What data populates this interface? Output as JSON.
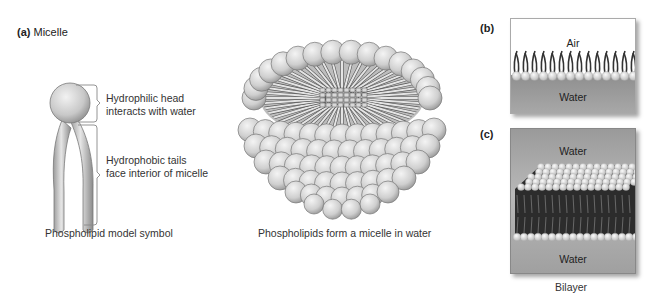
{
  "panel_a": {
    "tag": "(a)",
    "title": "Micelle",
    "annotations": {
      "head_line1": "Hydrophilic head",
      "head_line2": "interacts with water",
      "tails_line1": "Hydrophobic tails",
      "tails_line2": "face interior of micelle"
    },
    "symbol_caption": "Phospholipid model symbol",
    "micelle_caption": "Phospholipids form a micelle in water"
  },
  "panel_b": {
    "tag": "(b)",
    "top_label": "Air",
    "bottom_label": "Water"
  },
  "panel_c": {
    "tag": "(c)",
    "top_label": "Water",
    "bottom_label": "Water",
    "caption": "Bilayer"
  },
  "colors": {
    "sphere": "#d9d9d9",
    "sphere_edge": "#7a7a7a",
    "water": "#9a9a9a",
    "tails_dark": "#2a2a2a"
  }
}
